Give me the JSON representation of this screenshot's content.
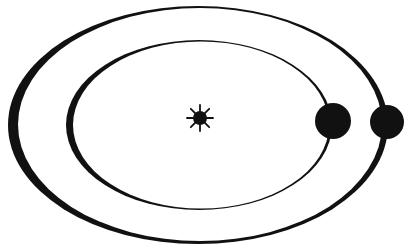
{
  "diagram": {
    "colors": {
      "ink": "#111111",
      "background": "#ffffff"
    },
    "sun": {
      "label": "Sun",
      "icon": "sun-icon",
      "cx": 200,
      "cy": 118,
      "r": 7,
      "ray_length": 13,
      "rays": 8
    },
    "orbits": [
      {
        "name": "inner-orbit",
        "label": "Inner orbit",
        "cx": 199,
        "cy": 125,
        "rx": 133,
        "ry": 85,
        "inner_cx": 201,
        "inner_cy": 125,
        "inner_rx": 128,
        "inner_ry": 83.5
      },
      {
        "name": "outer-orbit",
        "label": "Outer orbit",
        "cx": 198,
        "cy": 125,
        "rx": 190,
        "ry": 119,
        "inner_cx": 200,
        "inner_cy": 124.5,
        "inner_rx": 182,
        "inner_ry": 116.5
      }
    ],
    "planets": [
      {
        "name": "inner-planet",
        "label": "Inner planet",
        "cx": 333,
        "cy": 121,
        "r": 18
      },
      {
        "name": "outer-planet",
        "label": "Outer planet",
        "cx": 387,
        "cy": 122,
        "r": 17
      }
    ]
  }
}
